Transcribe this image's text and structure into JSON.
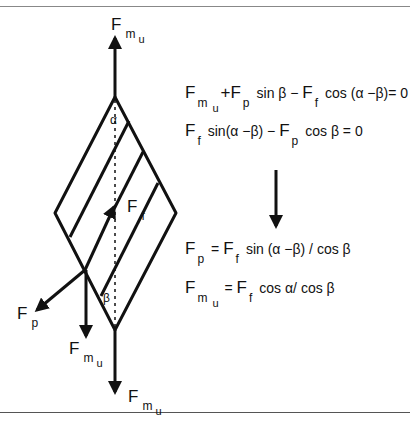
{
  "labels": {
    "top_force": {
      "main": "F",
      "sub": "m",
      "subsub": "u"
    },
    "bottom_force": {
      "main": "F",
      "sub": "m",
      "subsub": "u"
    },
    "left_down_force": {
      "main": "F",
      "sub": "m",
      "subsub": "u"
    },
    "friction_force": {
      "main": "F",
      "sub": "f"
    },
    "pressure_force": {
      "main": "F",
      "sub": "p"
    },
    "alpha": "α",
    "beta": "β"
  },
  "equations": {
    "eq1": {
      "F1": "F",
      "s1": "m",
      "s1b": "u",
      "op1": "+F",
      "s2": "p",
      "t1": "sin β −",
      "F3": "F",
      "s3": "f",
      "t2": "cos (α −β)= 0"
    },
    "eq2": {
      "F1": "F",
      "s1": "f",
      "t1": "sin(α −β) −",
      "F2": "F",
      "s2": "p",
      "t2": "cos β = 0"
    },
    "eq3": {
      "F1": "F",
      "s1": "p",
      "t1": "=",
      "F2": "F",
      "s2": "f",
      "t2": "sin (α −β) / cos β"
    },
    "eq4": {
      "F1": "F",
      "s1": "m",
      "s1b": "u",
      "t1": "=",
      "F2": "F",
      "s2": "f",
      "t2": "cos α/ cos β"
    }
  },
  "colors": {
    "ink": "#111111",
    "background": "#ffffff"
  }
}
